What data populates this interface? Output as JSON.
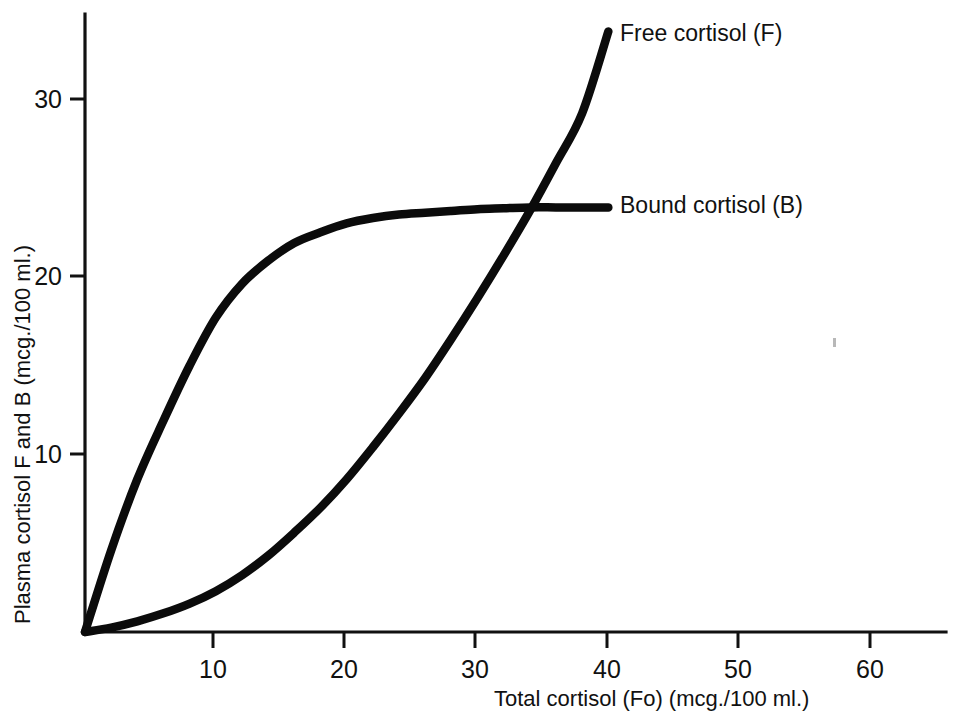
{
  "chart_data": {
    "type": "line",
    "title": "",
    "subtitle": "",
    "xlabel": "Total cortisol (Fo)  (mcg./100 ml.)",
    "ylabel": "Plasma cortisol F and B  (mcg./100 ml.)",
    "xlim": [
      0,
      65
    ],
    "ylim": [
      0,
      34.5
    ],
    "xticks": [
      10,
      20,
      30,
      40,
      50,
      60
    ],
    "xtick_labels": [
      "10",
      "20",
      "30",
      "40",
      "50",
      "60"
    ],
    "yticks": [
      10,
      20,
      30
    ],
    "ytick_labels": [
      "10",
      "20",
      "30"
    ],
    "grid": false,
    "legend_position": "inline-right-of-curve-ends",
    "annotations": [
      {
        "text": "Free cortisol (F)",
        "x": 41.5,
        "y": 33.8
      },
      {
        "text": "Bound cortisol (B)",
        "x": 41.5,
        "y": 23.9
      }
    ],
    "series": [
      {
        "name": "Free cortisol (F)",
        "label": "Free cortisol (F)",
        "color": "#0b0b0b",
        "x": [
          0,
          2,
          4,
          6,
          8,
          10,
          12,
          14,
          16,
          18,
          20,
          22,
          24,
          26,
          28,
          30,
          32,
          34,
          36,
          38,
          40
        ],
        "y": [
          0.0,
          0.25,
          0.6,
          1.05,
          1.6,
          2.3,
          3.2,
          4.3,
          5.6,
          7.0,
          8.6,
          10.4,
          12.3,
          14.3,
          16.5,
          18.8,
          21.2,
          23.7,
          26.4,
          29.2,
          33.8
        ]
      },
      {
        "name": "Bound cortisol (B)",
        "label": "Bound cortisol (B)",
        "color": "#0b0b0b",
        "x": [
          0,
          2,
          4,
          6,
          8,
          10,
          12,
          14,
          16,
          18,
          20,
          22,
          24,
          26,
          28,
          30,
          32,
          34,
          36,
          38,
          40
        ],
        "y": [
          0.0,
          4.6,
          8.6,
          11.9,
          15.0,
          17.7,
          19.6,
          20.9,
          21.9,
          22.5,
          23.0,
          23.3,
          23.5,
          23.6,
          23.7,
          23.8,
          23.85,
          23.9,
          23.9,
          23.9,
          23.9
        ]
      }
    ],
    "crossing_point": {
      "x": 32.6,
      "y": 23.9
    }
  },
  "axes": {
    "x_axis_label": "Total cortisol (Fo)  (mcg./100 ml.)",
    "y_axis_label": "Plasma cortisol F and B  (mcg./100 ml.)"
  },
  "labels": {
    "free": "Free cortisol (F)",
    "bound": "Bound cortisol (B)"
  }
}
